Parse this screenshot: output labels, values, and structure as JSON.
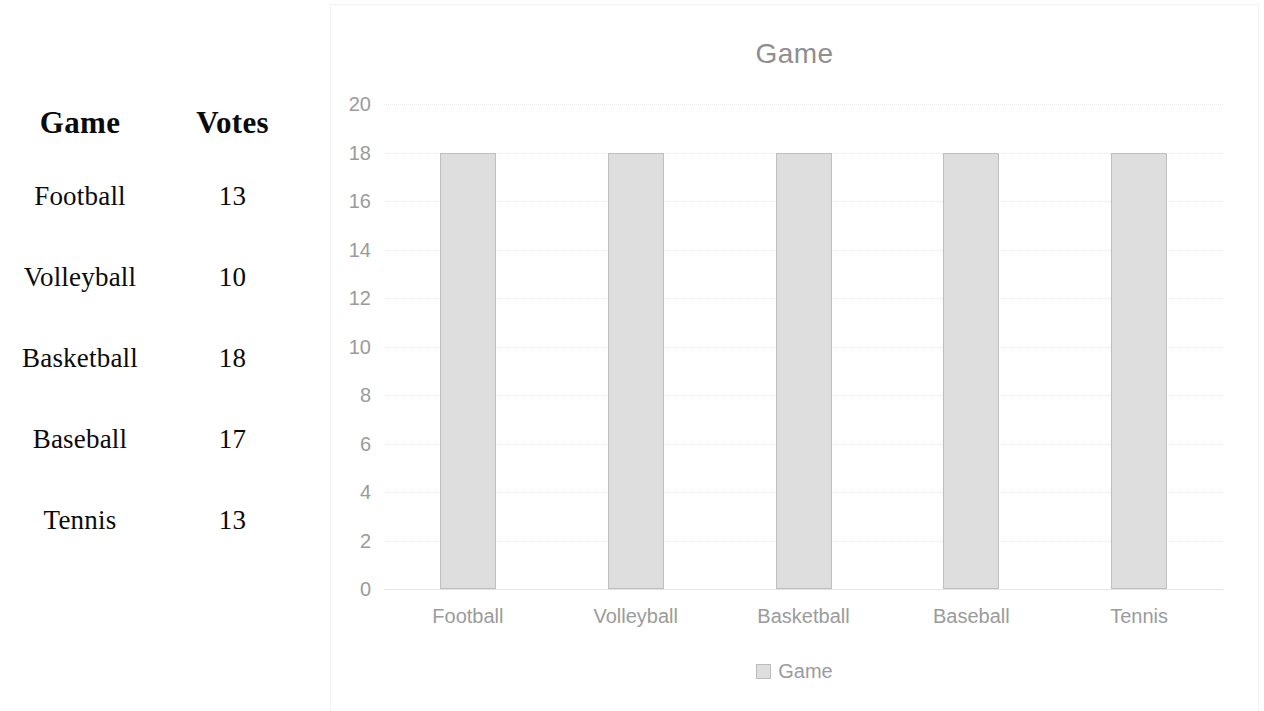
{
  "table": {
    "headers": [
      "Game",
      "Votes"
    ],
    "rows": [
      {
        "game": "Football",
        "votes": "13"
      },
      {
        "game": "Volleyball",
        "votes": "10"
      },
      {
        "game": "Basketball",
        "votes": "18"
      },
      {
        "game": "Baseball",
        "votes": "17"
      },
      {
        "game": "Tennis",
        "votes": "13"
      }
    ]
  },
  "chart_data": {
    "type": "bar",
    "title": "Game",
    "xlabel": "",
    "ylabel": "",
    "categories": [
      "Football",
      "Volleyball",
      "Basketball",
      "Baseball",
      "Tennis"
    ],
    "values": [
      18,
      18,
      18,
      18,
      18
    ],
    "series": [
      {
        "name": "Game",
        "values": [
          18,
          18,
          18,
          18,
          18
        ]
      }
    ],
    "ylim": [
      0,
      20
    ],
    "ytick_labels": [
      "20",
      "18",
      "16",
      "14",
      "12",
      "10",
      "8",
      "6",
      "4",
      "2",
      "0"
    ],
    "yticks": [
      20,
      18,
      16,
      14,
      12,
      10,
      8,
      6,
      4,
      2,
      0
    ],
    "grid": true,
    "legend": {
      "position": "bottom",
      "entries": [
        "Game"
      ]
    },
    "bar_color": "#dedede",
    "bar_border_color": "#bfbfbf",
    "text_color": "#9b9b9b",
    "title_color": "#8f8f8f"
  },
  "legend": {
    "swatch_icon": "legend-swatch-icon",
    "label": "Game"
  }
}
